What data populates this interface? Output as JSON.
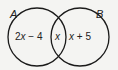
{
  "diagram": {
    "type": "venn",
    "sets": [
      {
        "name": "A",
        "only_region": "2x − 4"
      },
      {
        "name": "B",
        "only_region": "x + 5"
      }
    ],
    "intersection": "x",
    "colors": {
      "stroke": "#1a1a1a",
      "background": "#f4f4f2"
    }
  },
  "labels": {
    "set_a": "A",
    "set_b": "B",
    "a_only_coef": "2",
    "a_only_var": "x",
    "a_only_rest": " − 4",
    "intersection": "x",
    "b_only_var": "x",
    "b_only_rest": " + 5"
  }
}
